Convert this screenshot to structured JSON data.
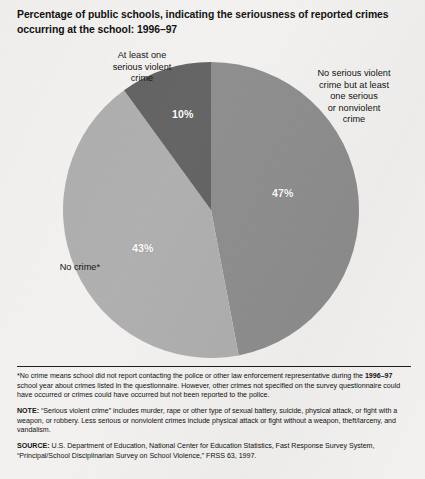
{
  "figure": {
    "title": "Percentage of public schools, indicating the seriousness of reported crimes occurring at the school: 1996–97",
    "background_color": "#f2f1ef",
    "text_color": "#101010"
  },
  "callouts": {
    "violent": "At least one\nserious violent\ncrime",
    "nonviolent": "No serious violent\ncrime but at least\none serious\nor nonviolent\ncrime",
    "nocrime": "No crime*"
  },
  "slice_labels": {
    "violent": "10%",
    "nonviolent": "47%",
    "nocrime": "43%"
  },
  "notes": {
    "footnote_star_prefix": "*",
    "footnote_a_part1": "No crime means school did not report contacting the police or other law enforcement representative during the ",
    "footnote_a_bold": "1996–97",
    "footnote_a_part2": " school year about crimes listed in the questionnaire. However, other crimes not specified on the survey questionnaire could have occurred or crimes could have occurred but not been reported to the police.",
    "note_label": "NOTE:",
    "note_body": " “Serious violent crime” includes murder, rape or other type of sexual battery, suicide, physical attack, or fight with a weapon, or robbery. Less serious or nonviolent crimes include physical attack or fight without a weapon, theft/larceny, and vandalism.",
    "source_label": "SOURCE:",
    "source_body": " U.S. Department of Education, National Center for Education Statistics, Fast Response Survey System, “Principal/School Disciplinarian Survey on School Violence,” FRSS 63, 1997."
  },
  "chart_data": {
    "type": "pie",
    "title": "Percentage of public schools, indicating the seriousness of reported crimes occurring at the school: 1996–97",
    "xlabel": "",
    "ylabel": "",
    "grid": false,
    "legend_position": "callout-labels-around-pie",
    "start_angle_deg": 0,
    "direction": "clockwise",
    "units": "percent",
    "total": 100,
    "categories": [
      "No serious violent crime but at least one serious or nonviolent crime",
      "No crime*",
      "At least one serious violent crime"
    ],
    "values": [
      47,
      43,
      10
    ],
    "data_labels": [
      "47%",
      "43%",
      "10%"
    ],
    "slices": [
      {
        "label": "No serious violent crime but at least one serious or nonviolent crime",
        "short_label": "No serious violent crime but at least one serious or nonviolent crime",
        "value": 47,
        "data_label": "47%",
        "color": "#8d8d8d",
        "start_angle_deg": 0,
        "end_angle_deg": 169.2
      },
      {
        "label": "No crime*",
        "short_label": "No crime*",
        "value": 43,
        "data_label": "43%",
        "color": "#aeaeae",
        "start_angle_deg": 169.2,
        "end_angle_deg": 324.0
      },
      {
        "label": "At least one serious violent crime",
        "short_label": "At least one serious violent crime",
        "value": 10,
        "data_label": "10%",
        "color": "#626262",
        "start_angle_deg": 324.0,
        "end_angle_deg": 360.0
      }
    ]
  }
}
